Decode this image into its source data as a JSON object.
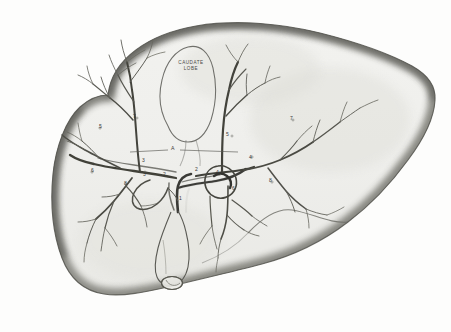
{
  "figure": {
    "background_color": "#fdfdfc",
    "ink_color": "#3a3a38",
    "wash_color": "#8d8d88",
    "medium": "pencil and wash anatomical drawing"
  },
  "annotations": {
    "caudate_lobe_line1": "CAUDATE",
    "caudate_lobe_line2": "LOBE",
    "letter_a": "A",
    "n1": "1",
    "n2": "2",
    "n3": "3",
    "n4": "4",
    "n5_left": "5",
    "n5_right": "5",
    "n6_left": "6",
    "n6_right": "6",
    "n7_left": "7",
    "n7_right": "7",
    "n8_left": "8",
    "n8_right": "8",
    "n9": "9"
  },
  "structures": {
    "liver_outline": "liver-silhouette",
    "caudate_lobe": "caudate-lobe-outline",
    "gallbladder": "gallbladder-outline",
    "portal_trunk": "portal-vein-trunk",
    "left_branch": "left-portal-branch",
    "right_branch": "right-portal-branch",
    "bile_duct": "common-bile-duct",
    "falciform_notch": "inferior-margin-notch"
  }
}
